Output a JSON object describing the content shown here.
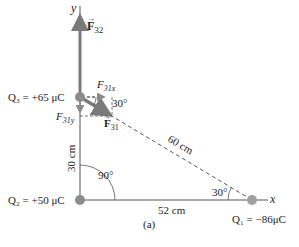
{
  "diagram": {
    "caption": "(a)",
    "axes": {
      "x_label": "x",
      "y_label": "y"
    },
    "charges": [
      {
        "id": "Q1",
        "label": "Q₁ = −86μC",
        "value_uC": -86
      },
      {
        "id": "Q2",
        "label": "Q₂ = +50 μC",
        "value_uC": 50
      },
      {
        "id": "Q3",
        "label": "Q₃ = +65 μC",
        "value_uC": 65
      }
    ],
    "distances": {
      "q2_q3": "30 cm",
      "q2_q1": "52 cm",
      "q3_q1": "60 cm"
    },
    "angles": {
      "at_q2": "90°",
      "at_q1": "30°",
      "at_q3": "30°"
    },
    "forces": {
      "f32": "F⃗32",
      "f31": "F⃗31",
      "f31x": "F31x",
      "f31y": "F31y"
    },
    "colors": {
      "force_vector": "#7a7a7a",
      "charge_dot": "#8c8c8c",
      "lines": "#555555"
    }
  }
}
